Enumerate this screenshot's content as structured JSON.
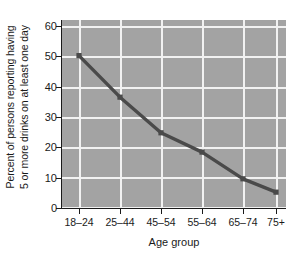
{
  "chart_data": {
    "type": "line",
    "title": "",
    "subtitle": "",
    "xlabel": "Age group",
    "ylabel": "Percent of persons reporting having 5 or more drinks on at least one day",
    "ylabel_line1": "Percent of persons reporting having",
    "ylabel_line2": "5 or more drinks on at least one day",
    "categories": [
      "18–24",
      "25–44",
      "45–54",
      "55–64",
      "65–74",
      "75+"
    ],
    "values": [
      51,
      37,
      25,
      18.5,
      9.5,
      5
    ],
    "series": [
      {
        "name": "Percent reporting 5+ drinks on at least one day",
        "values": [
          51,
          37,
          25,
          18.5,
          9.5,
          5
        ]
      }
    ],
    "ylim": [
      0,
      63
    ],
    "yticks": [
      0,
      10,
      20,
      30,
      40,
      50,
      60
    ],
    "ytick_labels": [
      "0",
      "10",
      "20",
      "30",
      "40",
      "50",
      "60"
    ],
    "grid": true,
    "grid_color": "#f2f2f2",
    "plot_background": "#a3a3a3",
    "line_color": "#4a4a4a",
    "marker": "square",
    "legend": false,
    "legend_position": "none"
  }
}
